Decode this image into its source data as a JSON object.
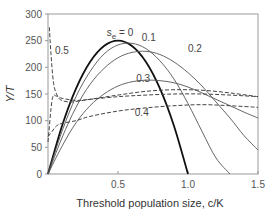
{
  "chart_data": {
    "type": "line",
    "title": "",
    "xlabel": "Threshold population size, c/K",
    "ylabel": "Y/T",
    "xlim": [
      0,
      1.5
    ],
    "ylim": [
      0,
      300
    ],
    "xticks": [
      "0.5",
      "1.0",
      "1.5"
    ],
    "xtick_values": [
      0.5,
      1.0,
      1.5
    ],
    "yticks": [
      "0",
      "50",
      "100",
      "150",
      "200",
      "250",
      "300"
    ],
    "ytick_values": [
      0,
      50,
      100,
      150,
      200,
      250,
      300
    ],
    "grid": false,
    "series": [
      {
        "name": "s_e = 0",
        "style": "solid-thick",
        "x": [
          0,
          0.1,
          0.2,
          0.3,
          0.4,
          0.5,
          0.6,
          0.7,
          0.8,
          0.9,
          1.0
        ],
        "y": [
          0,
          90,
          160,
          210,
          240,
          250,
          240,
          210,
          160,
          90,
          0
        ]
      },
      {
        "name": "0.1",
        "style": "solid",
        "x": [
          0,
          0.1,
          0.2,
          0.3,
          0.4,
          0.5,
          0.6,
          0.7,
          0.8,
          0.9,
          1.0,
          1.1,
          1.2,
          1.3
        ],
        "y": [
          0,
          80,
          145,
          192,
          225,
          242,
          245,
          235,
          212,
          178,
          132,
          80,
          30,
          0
        ]
      },
      {
        "name": "0.2",
        "style": "solid",
        "x": [
          0,
          0.1,
          0.2,
          0.3,
          0.4,
          0.5,
          0.6,
          0.7,
          0.8,
          0.9,
          1.0,
          1.1,
          1.2,
          1.3,
          1.4,
          1.5
        ],
        "y": [
          0,
          68,
          125,
          168,
          198,
          218,
          228,
          230,
          224,
          210,
          190,
          165,
          135,
          105,
          72,
          45
        ]
      },
      {
        "name": "0.3",
        "style": "solid",
        "x": [
          0,
          0.1,
          0.2,
          0.3,
          0.4,
          0.5,
          0.6,
          0.7,
          0.8,
          0.9,
          1.0,
          1.1,
          1.2,
          1.3,
          1.4,
          1.5
        ],
        "y": [
          0,
          52,
          96,
          128,
          150,
          165,
          173,
          176,
          175,
          171,
          163,
          152,
          140,
          128,
          116,
          105
        ]
      },
      {
        "name": "0.3",
        "style": "dashed",
        "x": [
          0,
          0.03,
          0.06,
          0.1,
          0.2,
          0.3,
          0.5,
          0.7,
          0.9,
          1.1,
          1.3,
          1.5
        ],
        "y": [
          60,
          140,
          146,
          142,
          138,
          140,
          145,
          148,
          150,
          150,
          148,
          145
        ]
      },
      {
        "name": "0.4",
        "style": "dashed",
        "x": [
          0,
          0.03,
          0.06,
          0.1,
          0.2,
          0.3,
          0.5,
          0.7,
          0.9,
          1.1,
          1.3,
          1.5
        ],
        "y": [
          70,
          80,
          90,
          95,
          100,
          108,
          118,
          124,
          128,
          130,
          128,
          125
        ]
      },
      {
        "name": "0.5",
        "style": "dashed",
        "x": [
          0.01,
          0.02,
          0.04,
          0.07,
          0.1,
          0.15,
          0.2,
          0.3,
          0.5,
          0.7,
          0.9,
          1.1,
          1.3,
          1.5
        ],
        "y": [
          275,
          230,
          170,
          145,
          138,
          135,
          136,
          140,
          148,
          155,
          158,
          157,
          152,
          145
        ]
      }
    ],
    "annotations": [
      {
        "text": "s",
        "sub": "e",
        "rest": " = 0",
        "x": 0.42,
        "y": 258
      },
      {
        "text": "0.1",
        "x": 0.67,
        "y": 250
      },
      {
        "text": "0.2",
        "x": 1.0,
        "y": 228
      },
      {
        "text": "0.3",
        "x": 0.63,
        "y": 172
      },
      {
        "text": "0.4",
        "x": 0.62,
        "y": 108
      },
      {
        "text": "0.5",
        "x": 0.05,
        "y": 225
      }
    ]
  }
}
